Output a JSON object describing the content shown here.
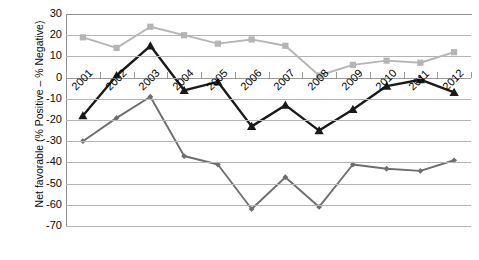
{
  "chart_data": {
    "type": "line",
    "title": "",
    "subtitle": "",
    "xlabel": "",
    "ylabel": "Net favorable (% Positive – % Negative)",
    "categories": [
      "2001",
      "2002",
      "2003",
      "2004",
      "2005",
      "2006",
      "2007",
      "2008",
      "2009",
      "2010",
      "2011",
      "2012"
    ],
    "x": [
      2001,
      2002,
      2003,
      2004,
      2005,
      2006,
      2007,
      2008,
      2009,
      2010,
      2011,
      2012
    ],
    "ylim": [
      -70,
      30
    ],
    "ytick_labels": [
      "30",
      "20",
      "10",
      "0",
      "-10",
      "-20",
      "-30",
      "-40",
      "-50",
      "-60",
      "-70"
    ],
    "ytick_values": [
      30,
      20,
      10,
      0,
      -10,
      -20,
      -30,
      -40,
      -50,
      -60,
      -70
    ],
    "ytick_step": 10,
    "grid": true,
    "legend": "none",
    "series": [
      {
        "name": "light-grey-squares",
        "marker": "square",
        "color": "#b5b5b5",
        "values": [
          19,
          14,
          24,
          20,
          16,
          18,
          15,
          1,
          6,
          8,
          7,
          12
        ]
      },
      {
        "name": "black-triangles",
        "marker": "triangle",
        "color": "#1a1a1a",
        "values": [
          -18,
          1,
          15,
          -6,
          -2,
          -23,
          -13,
          -25,
          -15,
          -4,
          -1,
          -7
        ]
      },
      {
        "name": "medium-grey-diamonds",
        "marker": "diamond",
        "color": "#6e6e6e",
        "values": [
          -30,
          -19,
          -9,
          -37,
          -41,
          -62,
          -47,
          -61,
          -41,
          -43,
          -44,
          -39
        ]
      }
    ]
  },
  "axis": {
    "ytitle": "Net favorable (% Positive – % Negative)"
  }
}
